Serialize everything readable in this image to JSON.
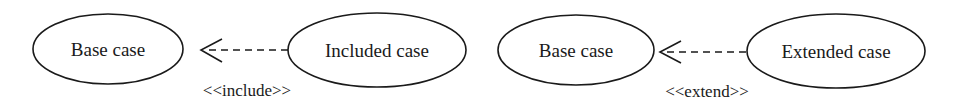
{
  "diagram": {
    "type": "uml-use-case-relationships",
    "colors": {
      "stroke": "#1a1a1a",
      "background": "#ffffff"
    },
    "panels": [
      {
        "source": {
          "label": "Included case"
        },
        "target": {
          "label": "Base case"
        },
        "relationship": {
          "stereotype": "<<include>>",
          "style": "dashed-open-arrow"
        }
      },
      {
        "source": {
          "label": "Extended case"
        },
        "target": {
          "label": "Base case"
        },
        "relationship": {
          "stereotype": "<<extend>>",
          "style": "dashed-open-arrow"
        }
      }
    ]
  }
}
